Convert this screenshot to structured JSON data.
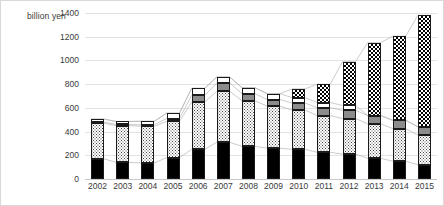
{
  "chart_data": {
    "type": "bar",
    "title": "",
    "subtitle": "",
    "xlabel": "",
    "ylabel": "billion yen",
    "ylim": [
      0,
      1400
    ],
    "ytick_step": 200,
    "yticks": [
      1400,
      1200,
      1000,
      800,
      600,
      400,
      200,
      0
    ],
    "grid": true,
    "legend": "none",
    "stacked": true,
    "connectors": true,
    "categories": [
      "2002",
      "2003",
      "2004",
      "2005",
      "2006",
      "2007",
      "2008",
      "2009",
      "2010",
      "2011",
      "2012",
      "2013",
      "2014",
      "2015"
    ],
    "series": [
      {
        "name": "segment-1",
        "pattern": "black",
        "values": [
          170,
          140,
          135,
          180,
          250,
          310,
          275,
          260,
          250,
          225,
          210,
          175,
          150,
          120
        ]
      },
      {
        "name": "segment-2",
        "pattern": "dotted",
        "values": [
          300,
          310,
          310,
          305,
          400,
          430,
          385,
          355,
          330,
          310,
          300,
          290,
          275,
          250
        ]
      },
      {
        "name": "segment-3",
        "pattern": "gray",
        "values": [
          10,
          10,
          12,
          25,
          55,
          70,
          60,
          55,
          60,
          65,
          70,
          70,
          70,
          70
        ]
      },
      {
        "name": "segment-4",
        "pattern": "white",
        "values": [
          25,
          25,
          30,
          45,
          60,
          50,
          50,
          50,
          45,
          45,
          40,
          0,
          0,
          0
        ]
      },
      {
        "name": "segment-5",
        "pattern": "checkered",
        "values": [
          0,
          0,
          0,
          0,
          0,
          0,
          0,
          0,
          75,
          155,
          370,
          615,
          710,
          940
        ]
      }
    ],
    "totals": [
      505,
      485,
      487,
      555,
      765,
      860,
      770,
      720,
      760,
      800,
      990,
      1150,
      1205,
      1380
    ]
  },
  "axis": {
    "y_label_text": "billion yen"
  }
}
